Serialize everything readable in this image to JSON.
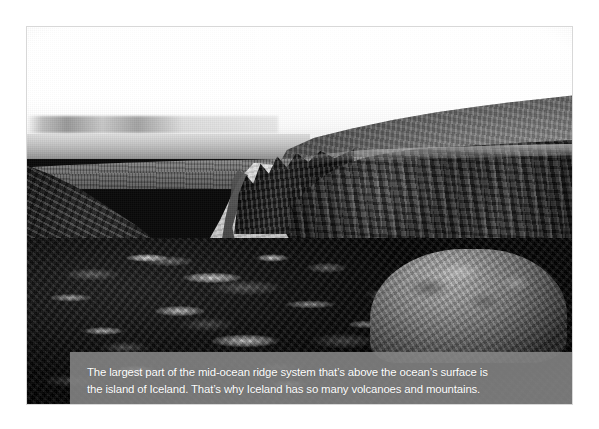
{
  "figure": {
    "photo": {
      "alt_description": "Black and white photograph of a rift valley in Iceland with dark basalt cliff walls on both sides, a pale gravel path and stream running down the centre, snow-patched lava rubble in the foreground, a large mossy boulder at lower right, and a bright overcast sky above a low horizon",
      "treatment": "grayscale",
      "subject": "mid-ocean ridge rift valley, Iceland"
    },
    "caption": {
      "line1": "The largest part of the mid-ocean ridge system that’s above the ocean’s surface is",
      "line2": "the island of Iceland. That’s why Iceland has so many volcanoes and mountains."
    }
  },
  "colors": {
    "page_background": "#ffffff",
    "caption_background": "#868686",
    "caption_text": "#ffffff",
    "photo_border": "#d8d8d8"
  }
}
